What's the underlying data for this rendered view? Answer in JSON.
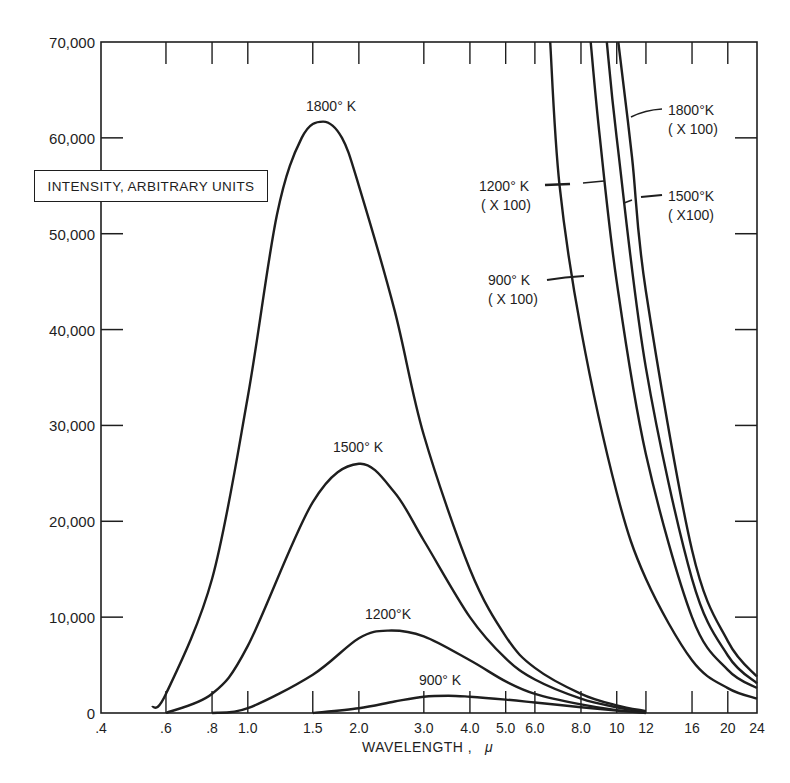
{
  "chart_data": {
    "type": "line",
    "title": "",
    "xlabel": "WAVELENGTH, μ",
    "ylabel": "INTENSITY, ARBITRARY UNITS",
    "xscale": "log",
    "xlim": [
      0.4,
      24
    ],
    "ylim": [
      0,
      70000
    ],
    "grid": false,
    "legend": "inline curve labels",
    "x_ticks": [
      ".4",
      ".6",
      ".8",
      "1.0",
      "1.5",
      "2.0",
      "3.0",
      "4.0",
      "5.0",
      "6.0",
      "8.0",
      "10",
      "12",
      "16",
      "20",
      "24"
    ],
    "y_ticks": [
      "0",
      "10,000",
      "20,000",
      "30,000",
      "40,000",
      "50,000",
      "60,000",
      "70,000"
    ],
    "series": [
      {
        "name": "1800° K",
        "multiplier": 1,
        "x": [
          0.55,
          0.6,
          0.8,
          1.0,
          1.2,
          1.4,
          1.6,
          1.8,
          2.0,
          2.5,
          3.0,
          4.0,
          5.0,
          6.0,
          8.0,
          10,
          12
        ],
        "values": [
          600,
          2000,
          14000,
          33000,
          52000,
          60000,
          61700,
          60000,
          55000,
          42000,
          29000,
          15000,
          8000,
          4700,
          2000,
          800,
          200
        ]
      },
      {
        "name": "1500° K",
        "multiplier": 1,
        "x": [
          0.6,
          0.8,
          1.0,
          1.5,
          2.0,
          2.5,
          3.0,
          4.0,
          5.0,
          6.0,
          8.0,
          10,
          12
        ],
        "values": [
          0,
          2000,
          7000,
          22000,
          26000,
          23000,
          18000,
          10000,
          5700,
          3500,
          1500,
          600,
          100
        ]
      },
      {
        "name": "1200° K",
        "multiplier": 1,
        "x": [
          0.8,
          1.0,
          1.5,
          2.0,
          2.4,
          3.0,
          4.0,
          5.0,
          6.0,
          8.0,
          10,
          12
        ],
        "values": [
          0,
          500,
          4000,
          7800,
          8600,
          8000,
          5500,
          3300,
          2000,
          900,
          300,
          50
        ]
      },
      {
        "name": "900° K",
        "multiplier": 1,
        "x": [
          1.5,
          2.0,
          2.5,
          3.0,
          3.5,
          4.0,
          5.0,
          6.0,
          8.0,
          10,
          12
        ],
        "values": [
          0,
          500,
          1200,
          1700,
          1800,
          1700,
          1400,
          1100,
          600,
          250,
          0
        ]
      },
      {
        "name": "900° K (X 100)",
        "multiplier": 100,
        "x": [
          6.6,
          7.0,
          8.0,
          10,
          12,
          16,
          20,
          24
        ],
        "values": [
          70000,
          55000,
          40000,
          23000,
          14000,
          5500,
          2600,
          1500
        ]
      },
      {
        "name": "1200° K (X 100)",
        "multiplier": 100,
        "x": [
          8.5,
          9.0,
          10,
          12,
          16,
          20,
          24
        ],
        "values": [
          70000,
          60000,
          45000,
          27000,
          10000,
          4500,
          2600
        ]
      },
      {
        "name": "1500° K (X 100)",
        "multiplier": 100,
        "x": [
          9.4,
          10,
          12,
          16,
          20,
          24
        ],
        "values": [
          70000,
          60000,
          36000,
          14000,
          6000,
          3100
        ]
      },
      {
        "name": "1800° K (X 100)",
        "multiplier": 100,
        "x": [
          10.1,
          11,
          12,
          16,
          20,
          24
        ],
        "values": [
          70000,
          58000,
          44000,
          17000,
          7500,
          3800
        ]
      }
    ]
  },
  "labels": {
    "ylabel": "INTENSITY, ARBITRARY UNITS",
    "xlabel": "WAVELENGTH ,",
    "xlabel_unit": "μ",
    "curve_1800": "1800° K",
    "curve_1500": "1500° K",
    "curve_1200": "1200°K",
    "curve_900": "900° K",
    "x100_1800_a": "1800°K",
    "x100_1800_b": "( X 100)",
    "x100_1500_a": "1500°K",
    "x100_1500_b": "( X100)",
    "x100_1200_a": "1200° K",
    "x100_1200_b": "( X 100)",
    "x100_900_a": "900° K",
    "x100_900_b": "( X 100)"
  },
  "colors": {
    "ink": "#1e1e1e",
    "background": "#ffffff"
  }
}
